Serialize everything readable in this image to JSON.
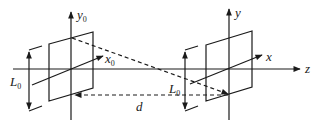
{
  "diagram": {
    "type": "coordinate-frames",
    "colors": {
      "stroke": "#1a1a1a",
      "background": "#ffffff"
    },
    "left_frame": {
      "y_label": "y",
      "y_sub": "0",
      "x_label": "x",
      "x_sub": "0",
      "size_label": "L",
      "size_sub": "0"
    },
    "right_frame": {
      "y_label": "y",
      "x_label": "x",
      "size_label": "L",
      "size_sub": "0"
    },
    "axis_label": "z",
    "distance_label": "d"
  }
}
